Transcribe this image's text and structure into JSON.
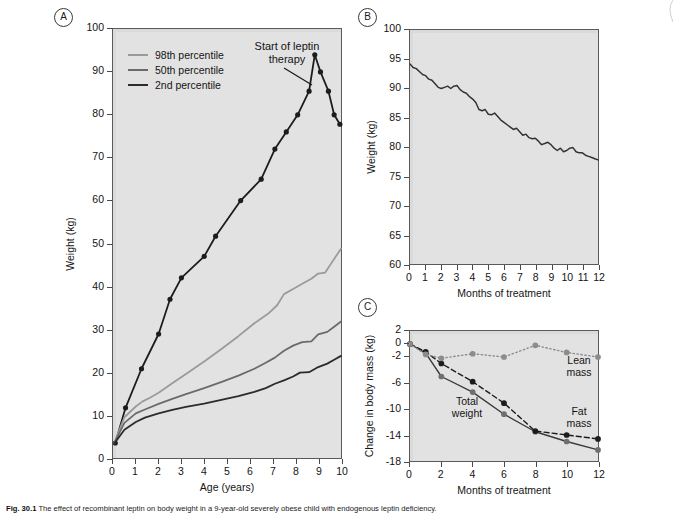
{
  "figure": {
    "caption_prefix": "Fig. 30.1",
    "caption_text": "The effect of recombinant leptin on body weight in a 9-year-old severely obese child with endogenous leptin deficiency."
  },
  "panels": {
    "a": {
      "badge": "A"
    },
    "b": {
      "badge": "B"
    },
    "c": {
      "badge": "C"
    }
  },
  "legend_a": {
    "items": [
      {
        "label": "98th percentile",
        "color": "#9a9a9a"
      },
      {
        "label": "50th percentile",
        "color": "#6a6a6a"
      },
      {
        "label": "2nd percentile",
        "color": "#2b2b2b"
      }
    ]
  },
  "annotations": {
    "start_of_leptin_line1": "Start of leptin",
    "start_of_leptin_line2": "therapy",
    "total_weight_line1": "Total",
    "total_weight_line2": "weight",
    "lean_mass_line1": "Lean",
    "lean_mass_line2": "mass",
    "fat_mass_line1": "Fat",
    "fat_mass_line2": "mass"
  },
  "chart_data": [
    {
      "id": "panel-a",
      "type": "line",
      "title": "",
      "xlabel": "Age (years)",
      "ylabel": "Weight (kg)",
      "xlim": [
        0,
        10
      ],
      "ylim": [
        0,
        100
      ],
      "xticks": [
        0,
        1,
        2,
        3,
        4,
        5,
        6,
        7,
        8,
        9,
        10
      ],
      "yticks": [
        0,
        10,
        20,
        30,
        40,
        50,
        60,
        70,
        80,
        90,
        100
      ],
      "grid": false,
      "legend_position": "top-left",
      "series": [
        {
          "name": "Patient weight",
          "color": "#1c1c1c",
          "style": "solid",
          "markers": true,
          "x": [
            0.1,
            0.55,
            1.25,
            2.0,
            2.5,
            3.0,
            4.0,
            4.5,
            5.6,
            6.5,
            7.1,
            7.6,
            8.1,
            8.6,
            8.85,
            9.1,
            9.45,
            9.7,
            9.95
          ],
          "y": [
            3.5,
            11.7,
            20.8,
            28.9,
            37.0,
            42.0,
            47.0,
            51.7,
            60.0,
            65.0,
            72.0,
            76.0,
            80.0,
            85.5,
            94.0,
            90.0,
            85.5,
            80.0,
            77.8
          ]
        },
        {
          "name": "98th percentile",
          "color": "#9a9a9a",
          "style": "solid",
          "markers": false,
          "x": [
            0.05,
            0.5,
            1.0,
            1.3,
            1.6,
            2.0,
            2.6,
            3.2,
            4.0,
            4.8,
            5.5,
            6.2,
            6.8,
            7.2,
            7.5,
            7.9,
            8.3,
            8.7,
            9.0,
            9.3,
            9.6,
            10.0
          ],
          "y": [
            3.4,
            9.5,
            12.0,
            13.2,
            14.0,
            15.2,
            17.4,
            19.6,
            22.5,
            25.6,
            28.4,
            31.4,
            33.6,
            35.6,
            38.2,
            39.4,
            40.6,
            41.8,
            43.0,
            43.2,
            45.6,
            48.8
          ]
        },
        {
          "name": "50th percentile",
          "color": "#6a6a6a",
          "style": "solid",
          "markers": false,
          "x": [
            0.05,
            0.5,
            1.0,
            1.4,
            2.0,
            2.6,
            3.2,
            4.0,
            4.8,
            5.5,
            6.2,
            6.7,
            7.1,
            7.5,
            7.9,
            8.3,
            8.7,
            9.0,
            9.4,
            9.7,
            10.0
          ],
          "y": [
            3.4,
            8.2,
            10.4,
            11.3,
            12.6,
            13.8,
            14.9,
            16.3,
            17.8,
            19.2,
            20.8,
            22.2,
            23.4,
            25.0,
            26.2,
            27.0,
            27.2,
            28.8,
            29.4,
            30.6,
            31.8
          ]
        },
        {
          "name": "2nd percentile",
          "color": "#2b2b2b",
          "style": "solid",
          "markers": false,
          "x": [
            0.05,
            0.5,
            1.0,
            1.4,
            2.0,
            2.6,
            3.2,
            4.0,
            4.8,
            5.5,
            6.2,
            6.7,
            7.1,
            7.5,
            7.9,
            8.2,
            8.6,
            9.0,
            9.4,
            9.7,
            10.0
          ],
          "y": [
            3.3,
            6.6,
            8.4,
            9.4,
            10.4,
            11.2,
            11.9,
            12.7,
            13.6,
            14.4,
            15.4,
            16.3,
            17.3,
            18.1,
            19.0,
            19.9,
            20.0,
            21.2,
            22.0,
            22.9,
            23.8
          ]
        }
      ]
    },
    {
      "id": "panel-b",
      "type": "line",
      "title": "",
      "xlabel": "Months of treatment",
      "ylabel": "Weight (kg)",
      "xlim": [
        0,
        12
      ],
      "ylim": [
        60,
        100
      ],
      "xticks": [
        0,
        1,
        2,
        3,
        4,
        5,
        6,
        7,
        8,
        9,
        10,
        11,
        12
      ],
      "yticks": [
        60,
        65,
        70,
        75,
        80,
        85,
        90,
        95,
        100
      ],
      "grid": false,
      "series": [
        {
          "name": "Weight during leptin therapy",
          "color": "#333333",
          "style": "solid",
          "markers": false,
          "x": [
            0.0,
            0.2,
            0.4,
            0.6,
            0.8,
            1.0,
            1.2,
            1.4,
            1.6,
            1.8,
            2.0,
            2.2,
            2.4,
            2.6,
            2.8,
            3.0,
            3.2,
            3.4,
            3.6,
            3.8,
            4.0,
            4.2,
            4.4,
            4.6,
            4.8,
            5.0,
            5.2,
            5.4,
            5.6,
            5.8,
            6.0,
            6.2,
            6.4,
            6.6,
            6.8,
            7.0,
            7.2,
            7.4,
            7.6,
            7.8,
            8.0,
            8.2,
            8.4,
            8.6,
            8.8,
            9.0,
            9.2,
            9.4,
            9.6,
            9.8,
            10.0,
            10.2,
            10.4,
            10.6,
            10.8,
            11.0,
            11.2,
            11.4,
            11.6,
            11.8,
            12.0
          ],
          "y": [
            94.2,
            93.6,
            93.4,
            92.9,
            92.4,
            92.2,
            91.6,
            91.4,
            90.8,
            90.2,
            90.0,
            90.2,
            90.4,
            90.0,
            90.4,
            90.5,
            89.8,
            89.4,
            89.2,
            88.6,
            88.2,
            87.6,
            86.4,
            86.2,
            86.4,
            85.6,
            85.5,
            85.8,
            85.2,
            84.6,
            84.2,
            83.8,
            83.4,
            83.0,
            83.2,
            82.6,
            82.0,
            82.2,
            81.6,
            81.4,
            81.5,
            81.0,
            80.4,
            80.6,
            80.8,
            80.4,
            79.8,
            79.4,
            79.8,
            79.2,
            79.4,
            79.8,
            79.9,
            79.2,
            79.0,
            79.0,
            78.6,
            78.4,
            78.2,
            78.0,
            77.8
          ]
        }
      ]
    },
    {
      "id": "panel-c",
      "type": "line",
      "title": "",
      "xlabel": "Months of treatment",
      "ylabel": "Change in body mass (kg)",
      "xlim": [
        0,
        12
      ],
      "ylim": [
        -18,
        2
      ],
      "xticks": [
        0,
        2,
        4,
        6,
        8,
        10,
        12
      ],
      "yticks": [
        2,
        0,
        -2,
        -6,
        -10,
        -14,
        -18
      ],
      "ytick_labels": [
        "2",
        "0",
        "-2",
        "-6",
        "-10",
        "-14",
        "-18"
      ],
      "grid": false,
      "series": [
        {
          "name": "Total weight",
          "color": "#3a3a3a",
          "marker_color": "#6f6f6f",
          "style": "solid",
          "markers": true,
          "x": [
            0,
            1,
            2,
            4,
            6,
            8,
            10,
            12
          ],
          "y": [
            0.0,
            -1.4,
            -5.0,
            -7.4,
            -10.8,
            -13.5,
            -15.0,
            -16.3
          ]
        },
        {
          "name": "Fat mass",
          "color": "#1c1c1c",
          "marker_color": "#1c1c1c",
          "style": "dashed",
          "markers": true,
          "x": [
            0,
            1,
            2,
            4,
            6,
            8,
            10,
            12
          ],
          "y": [
            0.0,
            -1.2,
            -3.0,
            -5.8,
            -9.1,
            -13.4,
            -14.0,
            -14.6
          ]
        },
        {
          "name": "Lean mass",
          "color": "#8c8c8c",
          "marker_color": "#8c8c8c",
          "style": "dotted",
          "markers": true,
          "x": [
            0,
            1,
            2,
            4,
            6,
            8,
            10,
            12
          ],
          "y": [
            0.0,
            -1.6,
            -2.2,
            -1.5,
            -2.0,
            -0.2,
            -1.3,
            -2.0
          ]
        }
      ]
    }
  ]
}
